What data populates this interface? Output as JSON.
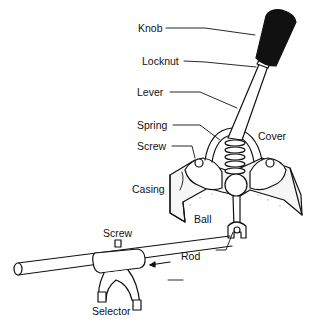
{
  "diagram": {
    "labels": {
      "knob": "Knob",
      "locknut": "Locknut",
      "lever": "Lever",
      "spring": "Spring",
      "screw_top": "Screw",
      "cover": "Cover",
      "casing": "Casing",
      "ball": "Ball",
      "screw_bottom": "Screw",
      "rod": "Rod",
      "selector": "Selector"
    },
    "colors": {
      "ink": "#111111",
      "knob_fill": "#111111",
      "casing_fill": "#f6f6f6",
      "background": "#ffffff"
    }
  }
}
